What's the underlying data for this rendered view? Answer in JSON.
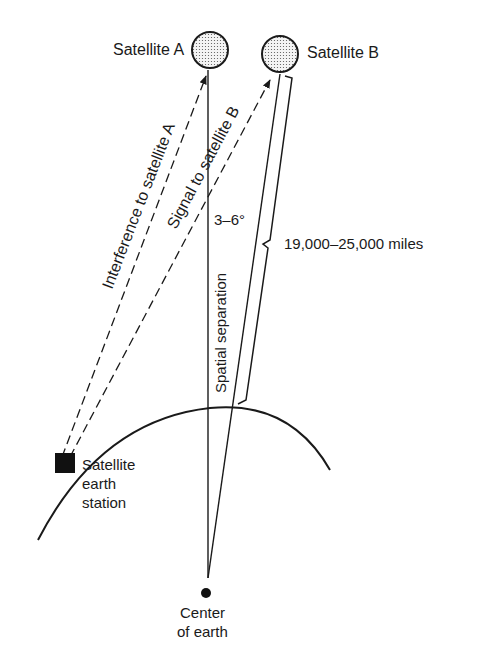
{
  "diagram": {
    "satellite_a": {
      "label": "Satellite A"
    },
    "satellite_b": {
      "label": "Satellite B"
    },
    "earth_station": {
      "label_lines": [
        "Satellite",
        "earth",
        "station"
      ]
    },
    "center": {
      "label_lines": [
        "Center",
        "of earth"
      ]
    },
    "interference_label": "Interference to satellite A",
    "signal_label": "Signal to satellite B",
    "angle_label": "3–6°",
    "spatial_label": "Spatial separation",
    "distance_label": "19,000–25,000 miles",
    "colors": {
      "ink": "#1a1a1a",
      "background": "#ffffff"
    }
  }
}
